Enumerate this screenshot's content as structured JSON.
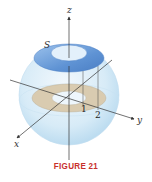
{
  "figure": {
    "caption": "FIGURE 21",
    "caption_color": "#c8302c",
    "labels": {
      "z_axis": "z",
      "y_axis": "y",
      "x_axis": "x",
      "surface": "S",
      "tick_1": "1",
      "tick_2": "2"
    },
    "colors": {
      "sphere": "#cfe6f5",
      "cap_surface": "#6f9fd8",
      "cap_hole": "#e3f0fb",
      "annulus": "#d9cbb0",
      "annulus_hole": "#eef6fc",
      "axis": "#333333"
    }
  }
}
